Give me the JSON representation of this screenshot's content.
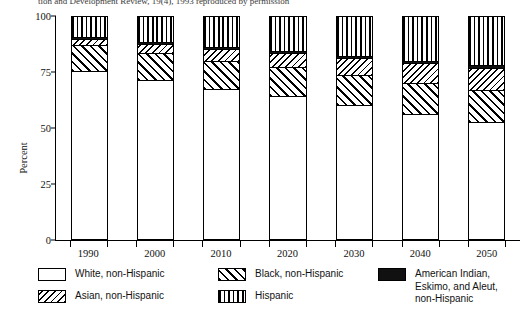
{
  "caption": "tion and Development Review, 19(4), 1993 reproduced by permission",
  "axes": {
    "ylabel": "Percent",
    "yticks": [
      "0",
      "25",
      "50",
      "75",
      "100"
    ],
    "xticks": [
      "1990",
      "2000",
      "2010",
      "2020",
      "2030",
      "2040",
      "2050"
    ]
  },
  "legend": {
    "items": [
      {
        "label": "White, non-Hispanic",
        "pattern": "solid-white",
        "swatch": "white-swatch"
      },
      {
        "label": "Asian, non-Hispanic",
        "pattern": "fine-backslash-hatch",
        "swatch": "asian-swatch"
      },
      {
        "label": "Black, non-Hispanic",
        "pattern": "coarse-forwardslash-hatch",
        "swatch": "black-nh-swatch"
      },
      {
        "label": "Hispanic",
        "pattern": "vertical-lines",
        "swatch": "hispanic-swatch"
      },
      {
        "label": "American Indian,\nEskimo, and Aleut,\nnon-Hispanic",
        "pattern": "solid-black",
        "swatch": "amerindian-swatch"
      }
    ]
  },
  "chart_data": {
    "type": "bar",
    "stacked": true,
    "title": "",
    "xlabel": "",
    "ylabel": "Percent",
    "ylim": [
      0,
      100
    ],
    "yticks": [
      0,
      25,
      50,
      75,
      100
    ],
    "grid": false,
    "legend_position": "bottom",
    "categories": [
      "1990",
      "2000",
      "2010",
      "2020",
      "2030",
      "2040",
      "2050"
    ],
    "series": [
      {
        "name": "White, non-Hispanic",
        "pattern": "solid-white",
        "values": [
          75.7,
          71.6,
          67.6,
          64.3,
          60.5,
          56.3,
          52.5
        ]
      },
      {
        "name": "Black, non-Hispanic",
        "pattern": "coarse-forwardslash-hatch",
        "values": [
          11.8,
          12.2,
          12.6,
          13.0,
          13.4,
          13.8,
          14.4
        ]
      },
      {
        "name": "Asian, non-Hispanic",
        "pattern": "fine-backslash-hatch",
        "values": [
          2.8,
          4.1,
          5.4,
          6.6,
          7.8,
          9.0,
          10.3
        ]
      },
      {
        "name": "American Indian, Eskimo, and Aleut, non-Hispanic",
        "pattern": "solid-black",
        "values": [
          0.8,
          0.8,
          0.9,
          0.9,
          0.9,
          1.0,
          1.0
        ]
      },
      {
        "name": "Hispanic",
        "pattern": "vertical-lines",
        "values": [
          8.9,
          11.3,
          13.5,
          15.2,
          17.4,
          19.9,
          21.8
        ]
      }
    ]
  }
}
